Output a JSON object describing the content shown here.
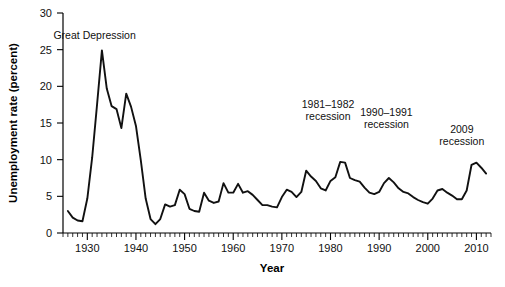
{
  "chart_data": {
    "type": "line",
    "title": "",
    "xlabel": "Year",
    "ylabel": "Unemployment rate (percent)",
    "xlim": [
      1925,
      2013
    ],
    "ylim": [
      0,
      30
    ],
    "grid": false,
    "legend": "none",
    "y_ticks": [
      0,
      5,
      10,
      15,
      20,
      25,
      30
    ],
    "y_tick_labels": [
      "0",
      "5",
      "10",
      "15",
      "20",
      "25",
      "30"
    ],
    "x_ticks": [
      1930,
      1940,
      1950,
      1960,
      1970,
      1980,
      1990,
      2000,
      2010
    ],
    "x_tick_labels": [
      "1930",
      "1940",
      "1950",
      "1960",
      "1970",
      "1980",
      "1990",
      "2000",
      "2010"
    ],
    "x_minor_tick_interval": 1,
    "series": [
      {
        "name": "Unemployment rate",
        "color": "#111111",
        "x": [
          1926,
          1927,
          1928,
          1929,
          1930,
          1931,
          1932,
          1933,
          1934,
          1935,
          1936,
          1937,
          1938,
          1939,
          1940,
          1941,
          1942,
          1943,
          1944,
          1945,
          1946,
          1947,
          1948,
          1949,
          1950,
          1951,
          1952,
          1953,
          1954,
          1955,
          1956,
          1957,
          1958,
          1959,
          1960,
          1961,
          1962,
          1963,
          1964,
          1965,
          1966,
          1967,
          1968,
          1969,
          1970,
          1971,
          1972,
          1973,
          1974,
          1975,
          1976,
          1977,
          1978,
          1979,
          1980,
          1981,
          1982,
          1983,
          1984,
          1985,
          1986,
          1987,
          1988,
          1989,
          1990,
          1991,
          1992,
          1993,
          1994,
          1995,
          1996,
          1997,
          1998,
          1999,
          2000,
          2001,
          2002,
          2003,
          2004,
          2005,
          2006,
          2007,
          2008,
          2009,
          2010,
          2011,
          2012
        ],
        "values": [
          3.0,
          2.1,
          1.7,
          1.6,
          4.7,
          10.3,
          17.5,
          24.9,
          19.7,
          17.3,
          16.9,
          14.3,
          19.0,
          17.2,
          14.6,
          9.9,
          4.7,
          1.9,
          1.2,
          1.9,
          3.9,
          3.6,
          3.8,
          5.9,
          5.3,
          3.3,
          3.0,
          2.9,
          5.5,
          4.4,
          4.1,
          4.3,
          6.8,
          5.5,
          5.5,
          6.7,
          5.5,
          5.7,
          5.2,
          4.5,
          3.8,
          3.8,
          3.6,
          3.5,
          4.9,
          5.9,
          5.6,
          4.9,
          5.6,
          8.5,
          7.7,
          7.1,
          6.1,
          5.8,
          7.1,
          7.6,
          9.7,
          9.6,
          7.5,
          7.2,
          7.0,
          6.2,
          5.5,
          5.3,
          5.6,
          6.8,
          7.5,
          6.9,
          6.1,
          5.6,
          5.4,
          4.9,
          4.5,
          4.2,
          4.0,
          4.7,
          5.8,
          6.0,
          5.5,
          5.1,
          4.6,
          4.6,
          5.8,
          9.3,
          9.6,
          8.9,
          8.1
        ]
      }
    ],
    "annotations": [
      {
        "id": "great-depression",
        "lines": [
          "Great Depression"
        ],
        "x": 1931.5,
        "y": 26.4
      },
      {
        "id": "recession-1981-1982",
        "lines": [
          "1981–1982",
          "recession"
        ],
        "x": 1979.5,
        "y": 17.0
      },
      {
        "id": "recession-1990-1991",
        "lines": [
          "1990–1991",
          "recession"
        ],
        "x": 1991.5,
        "y": 16.0
      },
      {
        "id": "recession-2009",
        "lines": [
          "2009",
          "recession"
        ],
        "x": 2007.0,
        "y": 13.6
      }
    ]
  }
}
